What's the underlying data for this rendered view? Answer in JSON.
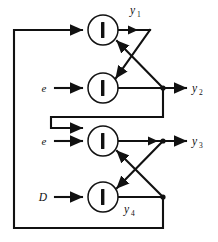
{
  "figure": {
    "kind": "signal-flow-diagram",
    "title": "",
    "background_color": "#ffffff",
    "line_color": "#111111",
    "node_fill_color": "#ffffff",
    "nodes": [
      {
        "id": "node-1",
        "glyph": "bar",
        "cx": 103,
        "cy": 30,
        "r": 15
      },
      {
        "id": "node-2",
        "glyph": "bar",
        "cx": 103,
        "cy": 88,
        "r": 15
      },
      {
        "id": "node-3",
        "glyph": "bar",
        "cx": 103,
        "cy": 141,
        "r": 15
      },
      {
        "id": "node-4",
        "glyph": "bar",
        "cx": 103,
        "cy": 197,
        "r": 15
      }
    ],
    "input_labels": [
      {
        "id": "input-2",
        "text": "e",
        "x": 44,
        "y": 92
      },
      {
        "id": "input-3",
        "text": "e",
        "x": 44,
        "y": 145
      },
      {
        "id": "input-4",
        "text": "D",
        "x": 43,
        "y": 201
      }
    ],
    "output_labels": [
      {
        "id": "output-1",
        "base": "y",
        "sub": "1",
        "x": 130,
        "y": 14
      },
      {
        "id": "output-2",
        "base": "y",
        "sub": "2",
        "x": 192,
        "y": 92
      },
      {
        "id": "output-3",
        "base": "y",
        "sub": "3",
        "x": 192,
        "y": 145
      },
      {
        "id": "output-4",
        "base": "y",
        "sub": "4",
        "x": 124,
        "y": 213
      }
    ]
  }
}
